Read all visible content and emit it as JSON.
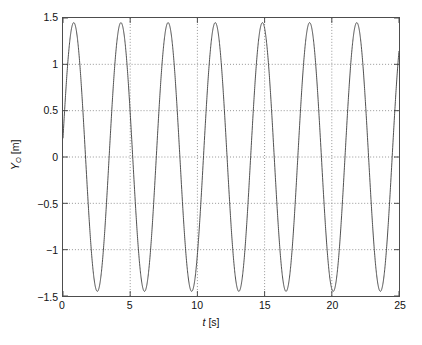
{
  "chart_data": {
    "type": "line",
    "title": "",
    "xlabel": "t [s]",
    "ylabel": "Y_O [m]",
    "ylabel_symbol": "Y",
    "ylabel_subscript": "O",
    "ylabel_unit": "[m]",
    "xlabel_symbol": "t",
    "xlabel_unit": "[s]",
    "xlim": [
      0,
      25
    ],
    "ylim": [
      -1.5,
      1.5
    ],
    "xticks": [
      0,
      5,
      10,
      15,
      20,
      25
    ],
    "yticks": [
      1.5,
      1,
      0.5,
      0,
      -0.5,
      -1,
      -1.5
    ],
    "xtick_labels": [
      "0",
      "5",
      "10",
      "15",
      "20",
      "25"
    ],
    "ytick_labels": [
      "1.5",
      "1",
      "0.5",
      "0",
      "-0.5",
      "-1",
      "-1.5"
    ],
    "grid": true,
    "grid_style": "dotted",
    "grid_color": "#7a7a7a",
    "legend": null,
    "line_color": "#3a3a3a",
    "line_width": 0.9,
    "axis_color": "#4d4d4d",
    "background": "#ffffff",
    "series": [
      {
        "name": "Y_O",
        "waveform": "sinusoid",
        "amplitude": 1.45,
        "period": 3.51,
        "frequency_hz": 0.2849,
        "phase_rad": 0.1396,
        "offset": 0.0,
        "value_at_t0": 0.2,
        "peaks_t": [
          0.89,
          4.4,
          7.91,
          11.42,
          14.93,
          18.44,
          21.95
        ],
        "peak_value": 1.45,
        "troughs_t": [
          2.64,
          6.15,
          9.66,
          13.17,
          16.68,
          20.19,
          23.7
        ],
        "trough_value": -1.45,
        "n_cycles": 7.1,
        "sample_points_t": [
          0,
          0.25,
          0.5,
          0.75,
          1,
          1.25,
          1.5,
          1.75,
          2,
          2.25,
          2.5,
          2.75,
          3,
          3.25,
          3.5,
          3.75,
          4,
          4.25,
          4.5,
          4.75,
          5,
          5.25,
          5.5,
          5.75,
          6,
          6.25,
          6.5,
          6.75,
          7,
          7.25,
          7.5,
          7.75,
          8,
          8.25,
          8.5,
          8.75,
          9,
          9.25,
          9.5,
          9.75,
          10,
          10.25,
          10.5,
          10.75,
          11,
          11.25,
          11.5,
          11.75,
          12,
          12.25,
          12.5,
          12.75,
          13,
          13.25,
          13.5,
          13.75,
          14,
          14.25,
          14.5,
          14.75,
          15,
          15.25,
          15.5,
          15.75,
          16,
          16.25,
          16.5,
          16.75,
          17,
          17.25,
          17.5,
          17.75,
          18,
          18.25,
          18.5,
          18.75,
          19,
          19.25,
          19.5,
          19.75,
          20,
          20.25,
          20.5,
          20.75,
          21,
          21.25,
          21.5,
          21.75,
          22,
          22.25,
          22.5,
          22.75,
          23,
          23.25,
          23.5,
          23.75,
          24,
          24.25,
          24.5,
          24.75,
          25
        ]
      }
    ]
  }
}
